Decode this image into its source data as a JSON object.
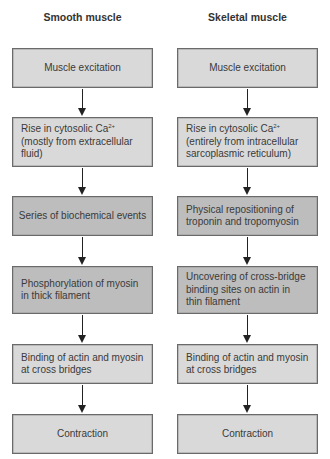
{
  "colors": {
    "light_box": "#d9d9d9",
    "dark_box": "#bdbdbd",
    "border": "#6a6a6a",
    "arrow": "#222222",
    "text": "#3a3a3a"
  },
  "columns": [
    {
      "header": "Smooth muscle",
      "steps": [
        {
          "line1": "Muscle excitation",
          "shade": "light"
        },
        {
          "line1": "Rise in cytosolic Ca",
          "sup": "2+",
          "line2": "(mostly from extracellular",
          "line3": "fluid)",
          "shade": "light"
        },
        {
          "line1": "Series of biochemical events",
          "shade": "dark"
        },
        {
          "line1": "Phosphorylation of myosin",
          "line2": "in thick filament",
          "shade": "dark"
        },
        {
          "line1": "Binding of actin and myosin",
          "line2": "at cross bridges",
          "shade": "light"
        },
        {
          "line1": "Contraction",
          "shade": "light"
        }
      ]
    },
    {
      "header": "Skeletal muscle",
      "steps": [
        {
          "line1": "Muscle excitation",
          "shade": "light"
        },
        {
          "line1": "Rise in cytosolic Ca",
          "sup": "2+",
          "line2": "(entirely from intracellular",
          "line3": "sarcoplasmic reticulum)",
          "shade": "light"
        },
        {
          "line1": "Physical repositioning of",
          "line2": "troponin and tropomyosin",
          "shade": "dark"
        },
        {
          "line1": "Uncovering of cross-bridge",
          "line2": "binding sites on actin in",
          "line3": "thin filament",
          "shade": "dark"
        },
        {
          "line1": "Binding of actin and myosin",
          "line2": "at cross bridges",
          "shade": "light"
        },
        {
          "line1": "Contraction",
          "shade": "light"
        }
      ]
    }
  ]
}
